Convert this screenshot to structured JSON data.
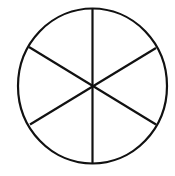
{
  "diagram": {
    "type": "circle-divided-into-sectors",
    "sectors": 6,
    "stroke_color": "#111111",
    "background": "#ffffff"
  }
}
